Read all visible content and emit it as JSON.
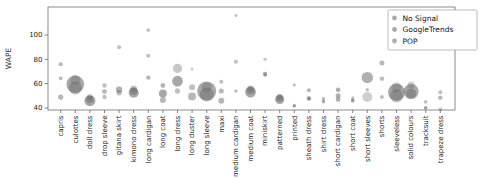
{
  "figure": {
    "ylabel": "WAPE"
  },
  "legend": {
    "position": "upper-right",
    "items": [
      {
        "label": "No Signal",
        "marker_color": "#8f8f8f"
      },
      {
        "label": "GoogleTrends",
        "marker_color": "#8a8a8a"
      },
      {
        "label": "POP",
        "marker_color": "#939393"
      }
    ]
  },
  "chart_data": {
    "type": "scatter",
    "title": "",
    "xlabel": "",
    "ylabel": "WAPE",
    "yticks": [
      40,
      60,
      80,
      100
    ],
    "ylim": [
      38,
      123
    ],
    "grid": false,
    "legend_position": "upper right",
    "bubble_color": "#5f5f5f",
    "frame_color": "#6f6f6f",
    "tick_label_color": "#222222",
    "series_names": [
      "No Signal",
      "GoogleTrends",
      "POP"
    ],
    "size_note": "r = bubble radius in px, alpha = gray intensity",
    "categories": [
      "capris",
      "culottes",
      "doll dress",
      "drop sleeve",
      "gitana skirt",
      "kimono dress",
      "long cardigan",
      "long coat",
      "long dress",
      "long duster",
      "long sleeve",
      "maxi",
      "medium cardigan",
      "medium coat",
      "miniskirt",
      "patterned",
      "printed",
      "sheath dress",
      "shirt dress",
      "short cardigan",
      "short coat",
      "short sleeves",
      "shorts",
      "sleeveless",
      "solid colours",
      "tracksuit",
      "trapeze dress"
    ],
    "bubbles": {
      "capris": [
        [
          76,
          2,
          0.45
        ],
        [
          64.5,
          2,
          0.4
        ],
        [
          49,
          2.6,
          0.45
        ]
      ],
      "culottes": [
        [
          63,
          5,
          0.3
        ],
        [
          59.5,
          8.8,
          0.55
        ],
        [
          56.5,
          6.5,
          0.4
        ]
      ],
      "doll dress": [
        [
          49,
          3,
          0.3
        ],
        [
          46,
          5.5,
          0.55
        ],
        [
          47,
          3.8,
          0.4
        ]
      ],
      "drop sleeve": [
        [
          58.5,
          2.2,
          0.4
        ],
        [
          53.5,
          2.4,
          0.45
        ],
        [
          49,
          2.2,
          0.4
        ]
      ],
      "gitana skirt": [
        [
          90,
          2,
          0.4
        ],
        [
          55,
          3.2,
          0.5
        ],
        [
          52.5,
          2.6,
          0.4
        ]
      ],
      "kimono dress": [
        [
          56,
          3.2,
          0.3
        ],
        [
          52.5,
          5,
          0.55
        ],
        [
          54,
          4,
          0.4
        ]
      ],
      "long cardigan": [
        [
          104,
          1.8,
          0.4
        ],
        [
          83,
          2,
          0.4
        ],
        [
          65,
          2.2,
          0.45
        ]
      ],
      "long coat": [
        [
          58.5,
          2.4,
          0.45
        ],
        [
          52,
          4,
          0.55
        ],
        [
          46.5,
          3,
          0.45
        ]
      ],
      "long dress": [
        [
          72.5,
          4.6,
          0.35
        ],
        [
          62,
          5.4,
          0.55
        ],
        [
          54,
          2.6,
          0.4
        ]
      ],
      "long duster": [
        [
          72,
          1.6,
          0.3
        ],
        [
          57,
          3,
          0.4
        ],
        [
          49.5,
          4,
          0.45
        ]
      ],
      "long sleeve": [
        [
          57,
          5,
          0.3
        ],
        [
          54,
          9.5,
          0.55
        ],
        [
          51,
          7,
          0.4
        ]
      ],
      "maxi": [
        [
          61.5,
          2,
          0.4
        ],
        [
          54,
          2.5,
          0.45
        ],
        [
          46,
          3,
          0.45
        ]
      ],
      "medium cardigan": [
        [
          116,
          1.5,
          0.4
        ],
        [
          78,
          2,
          0.4
        ],
        [
          54,
          1.8,
          0.4
        ]
      ],
      "medium coat": [
        [
          56,
          3.2,
          0.3
        ],
        [
          53,
          5.4,
          0.55
        ],
        [
          54.5,
          4,
          0.4
        ]
      ],
      "miniskirt": [
        [
          80,
          1.7,
          0.35
        ],
        [
          68,
          2.2,
          0.55
        ],
        [
          67,
          1.6,
          0.35
        ]
      ],
      "patterned": [
        [
          49.5,
          3,
          0.3
        ],
        [
          47,
          4.6,
          0.55
        ],
        [
          48,
          3.5,
          0.4
        ]
      ],
      "printed": [
        [
          59,
          1.6,
          0.4
        ],
        [
          42,
          1.8,
          0.45
        ],
        [
          41.5,
          1.5,
          0.35
        ]
      ],
      "sheath dress": [
        [
          54.5,
          2,
          0.45
        ],
        [
          48,
          2.2,
          0.5
        ],
        [
          47.5,
          1.8,
          0.4
        ]
      ],
      "shirt dress": [
        [
          48,
          1.6,
          0.4
        ],
        [
          46,
          1.8,
          0.45
        ],
        [
          45,
          1.5,
          0.4
        ]
      ],
      "short cardigan": [
        [
          55,
          2.3,
          0.5
        ],
        [
          50,
          2.5,
          0.5
        ],
        [
          47,
          2.3,
          0.5
        ]
      ],
      "short coat": [
        [
          48.5,
          1.5,
          0.4
        ],
        [
          46,
          2,
          0.45
        ],
        [
          46.5,
          1.6,
          0.4
        ]
      ],
      "short sleeves": [
        [
          65,
          5.7,
          0.5
        ],
        [
          55,
          1.8,
          0.4
        ],
        [
          49,
          5,
          0.3
        ]
      ],
      "shorts": [
        [
          77,
          2.5,
          0.45
        ],
        [
          64,
          2.3,
          0.4
        ],
        [
          49,
          2,
          0.4
        ]
      ],
      "sleeveless": [
        [
          57,
          5,
          0.3
        ],
        [
          53,
          8.5,
          0.55
        ],
        [
          50,
          6.5,
          0.4
        ]
      ],
      "solid colours": [
        [
          59,
          3.5,
          0.3
        ],
        [
          53.5,
          7.5,
          0.55
        ],
        [
          52,
          5,
          0.4
        ]
      ],
      "tracksuit": [
        [
          45,
          1.8,
          0.4
        ],
        [
          40,
          1.8,
          0.45
        ],
        [
          40.5,
          1.5,
          0.35
        ]
      ],
      "trapeze dress": [
        [
          53,
          2,
          0.4
        ],
        [
          48.5,
          2.2,
          0.45
        ],
        [
          39,
          1.8,
          0.4
        ]
      ]
    }
  }
}
